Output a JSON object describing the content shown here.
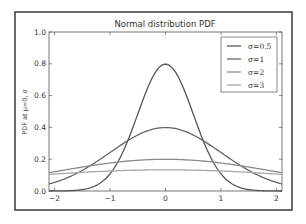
{
  "chart_data": {
    "type": "line",
    "title": "Normal distribution PDF",
    "xlabel": "",
    "ylabel": "PDF at μ=0, σ",
    "xlim": [
      -2.1,
      2.1
    ],
    "ylim": [
      0.0,
      1.0
    ],
    "xticks": [
      -2,
      -1,
      0,
      1,
      2
    ],
    "xtick_labels": [
      "−2",
      "−1",
      "0",
      "1",
      "2"
    ],
    "yticks": [
      0.0,
      0.2,
      0.4,
      0.6,
      0.8,
      1.0
    ],
    "ytick_labels": [
      "0.0",
      "0.2",
      "0.4",
      "0.6",
      "0.8",
      "1.0"
    ],
    "grid": false,
    "legend_position": "upper right",
    "mu": 0,
    "series": [
      {
        "name": "σ=0.5",
        "label": "σ=0.5",
        "sigma": 0.5,
        "color": "#555555",
        "peak": 0.8
      },
      {
        "name": "σ=1",
        "label": "σ=1",
        "sigma": 1,
        "color": "#666666",
        "peak": 0.4
      },
      {
        "name": "σ=2",
        "label": "σ=2",
        "sigma": 2,
        "color": "#8a8a8a",
        "peak": 0.2
      },
      {
        "name": "σ=3",
        "label": "σ=3",
        "sigma": 3,
        "color": "#a8a8a8",
        "peak": 0.13
      }
    ]
  }
}
